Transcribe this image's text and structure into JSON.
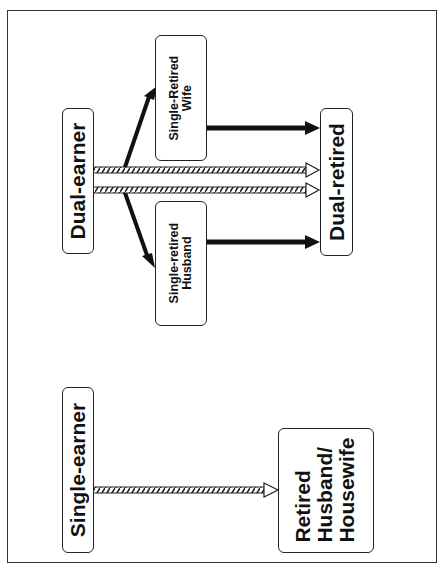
{
  "diagram": {
    "nodes": {
      "dual_earner": "Dual-earner",
      "single_retired_wife_l1": "Single-Retired",
      "single_retired_wife_l2": "Wife",
      "single_retired_husband_l1": "Single-retired",
      "single_retired_husband_l2": "Husband",
      "dual_retired": "Dual-retired",
      "single_earner": "Single-earner",
      "retired_hh_l1": "Retired",
      "retired_hh_l2": "Husband/",
      "retired_hh_l3": "Housewife"
    },
    "edges": [
      {
        "from": "Dual-earner",
        "to": "Single-Retired Wife",
        "style": "solid"
      },
      {
        "from": "Dual-earner",
        "to": "Single-retired Husband",
        "style": "solid"
      },
      {
        "from": "Dual-earner",
        "to": "Dual-retired",
        "style": "hatched"
      },
      {
        "from": "Dual-earner",
        "to": "Dual-retired",
        "style": "hatched"
      },
      {
        "from": "Single-Retired Wife",
        "to": "Dual-retired",
        "style": "solid"
      },
      {
        "from": "Single-retired Husband",
        "to": "Dual-retired",
        "style": "solid"
      },
      {
        "from": "Single-earner",
        "to": "Retired Husband/Housewife",
        "style": "hatched"
      }
    ]
  }
}
